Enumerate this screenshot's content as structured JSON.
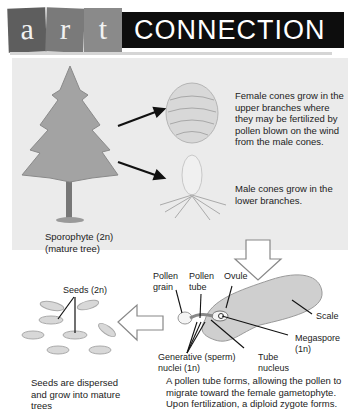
{
  "header": {
    "tiles": [
      "a",
      "r",
      "t"
    ],
    "title": "CONNECTION"
  },
  "top_panel": {
    "female_text": "Female cones grow in the upper branches where they may be fertilized by pollen blown on the wind from the male cones.",
    "male_text": "Male cones grow in the lower branches.",
    "tree_label_line1": "Sporophyte (2n)",
    "tree_label_line2": "(mature tree)"
  },
  "left_panel": {
    "seeds_label": "Seeds (2n)",
    "caption": "Seeds are dispersed and grow into mature trees"
  },
  "right_panel": {
    "labels": {
      "pollen_grain": "Pollen grain",
      "pollen_tube": "Pollen tube",
      "ovule": "Ovule",
      "scale": "Scale",
      "megaspore_line1": "Megaspore",
      "megaspore_line2": "(1n)",
      "generative_line1": "Generative (sperm)",
      "generative_line2": "nuclei (1n)",
      "tube_line1": "Tube",
      "tube_line2": "nucleus"
    },
    "caption": "A pollen tube forms, allowing the pollen to migrate toward the female gametophyte. Upon fertilization, a diploid zygote forms."
  },
  "colors": {
    "panel_bg": "#ebebeb",
    "header_bar": "#0d0d0d",
    "tree_foliage": "#9a9a9a",
    "text": "#222222"
  }
}
